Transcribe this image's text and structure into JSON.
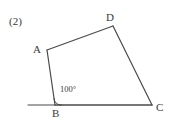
{
  "figure": {
    "item_number": "(2)",
    "shape_name": "quadrilateral-ABCD",
    "stroke_color": "#4a4a4a",
    "background_color": "#ffffff",
    "text_color": "#3a3a3a",
    "vertices": [
      {
        "name": "A",
        "label": "A",
        "x": 47,
        "y": 50
      },
      {
        "name": "B",
        "label": "B",
        "x": 55,
        "y": 105
      },
      {
        "name": "C",
        "label": "C",
        "x": 152,
        "y": 105
      },
      {
        "name": "D",
        "label": "D",
        "x": 113,
        "y": 26
      }
    ],
    "edges": [
      {
        "name": "A-D",
        "from": "A",
        "to": "D"
      },
      {
        "name": "D-C",
        "from": "D",
        "to": "C"
      },
      {
        "name": "C-B",
        "from": "C",
        "to": "B"
      },
      {
        "name": "B-A",
        "from": "B",
        "to": "A"
      }
    ],
    "extension_line": {
      "name": "baseline-through-B",
      "x1": 28,
      "y1": 105,
      "x2": 152,
      "y2": 105
    },
    "angle_marks": [
      {
        "name": "angle-at-B",
        "vertex": "B",
        "label": "100°",
        "value": 100,
        "radius": 7,
        "arc_path": "M 62 105 A 7 7 0 0 1 54.0 98.0"
      }
    ]
  }
}
